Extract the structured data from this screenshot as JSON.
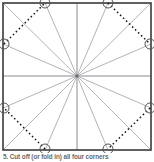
{
  "figure": {
    "caption": "5. Cut off (or fold in) all four corners",
    "caption_step_number": "5",
    "border_color": "#3a3a3a",
    "ray_color": "#9a9aa0",
    "axis_color": "#8c8c92",
    "dotted_color": "#1a1a1a",
    "circle_stroke": "#555555",
    "background": "#ffffff",
    "square": {
      "x": 3,
      "y": 3,
      "width": 148,
      "height": 147
    },
    "center": {
      "x": 77,
      "y": 76
    },
    "markers": [
      {
        "name": "marker-top-left",
        "cx": 45,
        "cy": 3,
        "r": 5
      },
      {
        "name": "marker-top-right",
        "cx": 108,
        "cy": 3,
        "r": 5
      },
      {
        "name": "marker-right-top",
        "cx": 150,
        "cy": 44,
        "r": 5
      },
      {
        "name": "marker-right-bottom",
        "cx": 150,
        "cy": 108,
        "r": 5
      },
      {
        "name": "marker-bottom-right",
        "cx": 108,
        "cy": 149,
        "r": 5
      },
      {
        "name": "marker-bottom-left",
        "cx": 45,
        "cy": 149,
        "r": 5
      },
      {
        "name": "marker-left-bottom",
        "cx": 4,
        "cy": 108,
        "r": 5
      },
      {
        "name": "marker-left-top",
        "cx": 4,
        "cy": 44,
        "r": 5
      }
    ],
    "dotted_corner_lines": [
      {
        "name": "corner-fold-top-left",
        "x1": 4,
        "y1": 44,
        "x2": 45,
        "y2": 3
      },
      {
        "name": "corner-fold-top-right",
        "x1": 108,
        "y1": 3,
        "x2": 150,
        "y2": 44
      },
      {
        "name": "corner-fold-bottom-right",
        "x1": 150,
        "y1": 108,
        "x2": 108,
        "y2": 149
      },
      {
        "name": "corner-fold-bottom-left",
        "x1": 45,
        "y1": 149,
        "x2": 4,
        "y2": 108
      }
    ],
    "rays": [
      {
        "name": "ray-to-top-left-corner",
        "x2": 3,
        "y2": 3
      },
      {
        "name": "ray-to-top-marker-left",
        "x2": 45,
        "y2": 3
      },
      {
        "name": "ray-to-top-center",
        "x2": 77,
        "y2": 3
      },
      {
        "name": "ray-to-top-marker-right",
        "x2": 108,
        "y2": 3
      },
      {
        "name": "ray-to-top-right-corner",
        "x2": 151,
        "y2": 3
      },
      {
        "name": "ray-to-right-marker-top",
        "x2": 151,
        "y2": 44
      },
      {
        "name": "ray-to-right-center",
        "x2": 151,
        "y2": 76
      },
      {
        "name": "ray-to-right-marker-bottom",
        "x2": 151,
        "y2": 108
      },
      {
        "name": "ray-to-bottom-right-corner",
        "x2": 151,
        "y2": 150
      },
      {
        "name": "ray-to-bottom-marker-right",
        "x2": 108,
        "y2": 150
      },
      {
        "name": "ray-to-bottom-center",
        "x2": 77,
        "y2": 150
      },
      {
        "name": "ray-to-bottom-marker-left",
        "x2": 45,
        "y2": 150
      },
      {
        "name": "ray-to-bottom-left-corner",
        "x2": 3,
        "y2": 150
      },
      {
        "name": "ray-to-left-marker-bottom",
        "x2": 3,
        "y2": 108
      },
      {
        "name": "ray-to-left-center",
        "x2": 3,
        "y2": 76
      },
      {
        "name": "ray-to-left-marker-top",
        "x2": 3,
        "y2": 44
      }
    ]
  }
}
